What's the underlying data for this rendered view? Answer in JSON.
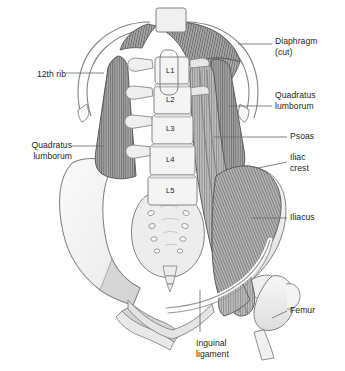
{
  "figure": {
    "background": "#ffffff",
    "ink": "#231f20",
    "leader_color": "#6d6e71",
    "bone_fill": "#f2f2f2",
    "bone_stroke": "#808285",
    "muscle_fill": "#9b9b9b",
    "muscle_stroke": "#58595b",
    "muscle_light": "#c4c4c4",
    "stripe_color": "#6d6e71"
  },
  "labels": {
    "diaphragm": {
      "text": "Diaphragm\n(cut)",
      "side": "right",
      "x": 275,
      "y": 36
    },
    "quadratus_lumborum_right": {
      "text": "Quadratus\nlumborum",
      "side": "right",
      "x": 275,
      "y": 90
    },
    "psoas": {
      "text": "Psoas",
      "side": "right",
      "x": 290,
      "y": 131
    },
    "iliac_crest": {
      "text": "Iliac\ncrest",
      "side": "right",
      "x": 290,
      "y": 152
    },
    "iliacus": {
      "text": "Iliacus",
      "side": "right",
      "x": 290,
      "y": 212
    },
    "femur": {
      "text": "Femur",
      "side": "right",
      "x": 290,
      "y": 305
    },
    "twelfth_rib": {
      "text": "12th rib",
      "side": "left",
      "x": 22,
      "y": 69
    },
    "quadratus_lumborum_left": {
      "text": "Quadratus\nlumborum",
      "side": "left",
      "x": 16,
      "y": 140
    },
    "inguinal_ligament": {
      "text": "Inguinal\nligament",
      "side": "center",
      "x": 196,
      "y": 338
    }
  },
  "vertebrae": [
    {
      "name": "L1",
      "x": 170,
      "y": 70
    },
    {
      "name": "L2",
      "x": 170,
      "y": 97
    },
    {
      "name": "L3",
      "x": 170,
      "y": 126
    },
    {
      "name": "L4",
      "x": 170,
      "y": 156
    },
    {
      "name": "L5",
      "x": 170,
      "y": 187
    }
  ]
}
